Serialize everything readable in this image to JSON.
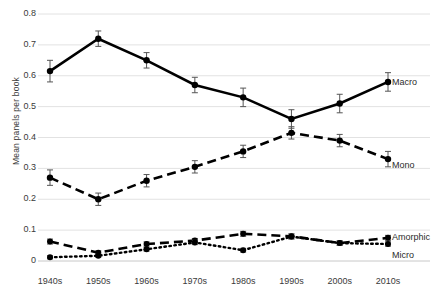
{
  "chart_data": {
    "type": "line",
    "title": "",
    "xlabel": "",
    "ylabel": "Mean  panels per book",
    "categories": [
      "1940s",
      "1950s",
      "1960s",
      "1970s",
      "1980s",
      "1990s",
      "2000s",
      "2010s"
    ],
    "ylim": [
      0,
      0.8
    ],
    "ytick_labels": [
      "0",
      "0.1",
      "0.2",
      "0.3",
      "0.4",
      "0.5",
      "0.6",
      "0.7",
      "0.8"
    ],
    "ytick_values": [
      0,
      0.1,
      0.2,
      0.3,
      0.4,
      0.5,
      0.6,
      0.7,
      0.8
    ],
    "grid": true,
    "legend": "inline-right-of-series",
    "errorbars": true,
    "series": [
      {
        "name": "Macro",
        "style": "solid",
        "marker": "circle",
        "values": [
          0.615,
          0.72,
          0.65,
          0.57,
          0.53,
          0.46,
          0.51,
          0.58
        ],
        "err_low": [
          0.035,
          0.025,
          0.025,
          0.025,
          0.03,
          0.03,
          0.03,
          0.03
        ],
        "err_high": [
          0.035,
          0.025,
          0.025,
          0.025,
          0.03,
          0.03,
          0.03,
          0.03
        ]
      },
      {
        "name": "Mono",
        "style": "dashed",
        "marker": "circle",
        "values": [
          0.27,
          0.2,
          0.26,
          0.305,
          0.355,
          0.415,
          0.39,
          0.33
        ],
        "err_low": [
          0.025,
          0.02,
          0.02,
          0.02,
          0.02,
          0.02,
          0.02,
          0.025
        ],
        "err_high": [
          0.025,
          0.02,
          0.02,
          0.02,
          0.02,
          0.02,
          0.02,
          0.025
        ]
      },
      {
        "name": "Amorphic",
        "style": "dashed",
        "marker": "circle",
        "values": [
          0.063,
          0.027,
          0.055,
          0.066,
          0.088,
          0.08,
          0.058,
          0.075
        ],
        "err_low": [
          0.008,
          0.006,
          0.007,
          0.007,
          0.008,
          0.008,
          0.007,
          0.008
        ],
        "err_high": [
          0.008,
          0.006,
          0.007,
          0.007,
          0.008,
          0.008,
          0.007,
          0.008
        ]
      },
      {
        "name": "Micro",
        "style": "dotted",
        "marker": "circle",
        "values": [
          0.012,
          0.017,
          0.038,
          0.06,
          0.035,
          0.079,
          0.058,
          0.055
        ],
        "err_low": [
          0.005,
          0.005,
          0.006,
          0.007,
          0.006,
          0.008,
          0.007,
          0.007
        ],
        "err_high": [
          0.005,
          0.005,
          0.006,
          0.007,
          0.006,
          0.008,
          0.007,
          0.007
        ]
      }
    ],
    "series_label_positions": [
      {
        "name": "Macro",
        "left": 392,
        "top": 77
      },
      {
        "name": "Mono",
        "left": 392,
        "top": 160
      },
      {
        "name": "Amorphic",
        "left": 392,
        "top": 232
      },
      {
        "name": "Micro",
        "left": 392,
        "top": 250
      }
    ]
  }
}
